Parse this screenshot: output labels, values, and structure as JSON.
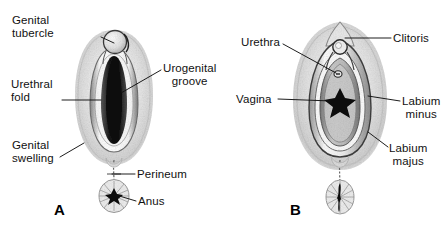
{
  "figure": {
    "type": "anatomical-diagram",
    "background_color": "#ffffff",
    "ink_color": "#1a1a1a",
    "panels": [
      {
        "id": "A",
        "letter": "A",
        "letter_pos": {
          "x": 54,
          "y": 201
        },
        "stage": "indifferent / early stage",
        "labels": [
          {
            "name": "genital-tubercle",
            "lines": [
              "Genital",
              "tubercle"
            ],
            "text": "Genital tubercle",
            "x": 12,
            "y": 14,
            "align": "left",
            "leader": [
              [
                101,
                37
              ],
              [
                114,
                43
              ]
            ]
          },
          {
            "name": "urethral-fold",
            "lines": [
              "Urethral",
              "fold"
            ],
            "text": "Urethral fold",
            "x": 11,
            "y": 78,
            "align": "left",
            "leader": [
              [
                62,
                100
              ],
              [
                101,
                100
              ]
            ]
          },
          {
            "name": "urogenital-groove",
            "lines": [
              "Urogenital",
              "groove"
            ],
            "text": "Urogenital groove",
            "x": 163,
            "y": 62,
            "align": "left",
            "leader": [
              [
                161,
                70
              ],
              [
                121,
                93
              ]
            ]
          },
          {
            "name": "genital-swelling",
            "lines": [
              "Genital",
              "swelling"
            ],
            "text": "Genital swelling",
            "x": 12,
            "y": 139,
            "align": "left",
            "leader": [
              [
                60,
                157
              ],
              [
                84,
                143
              ]
            ]
          },
          {
            "name": "perineum",
            "lines": [
              "Perineum"
            ],
            "text": "Perineum",
            "x": 137,
            "y": 168,
            "align": "left",
            "leader": [
              [
                135,
                174
              ],
              [
                112,
                174
              ]
            ]
          },
          {
            "name": "anus",
            "lines": [
              "Anus"
            ],
            "text": "Anus",
            "x": 138,
            "y": 195,
            "align": "left",
            "leader": [
              [
                136,
                201
              ],
              [
                116,
                195
              ]
            ]
          }
        ]
      },
      {
        "id": "B",
        "letter": "B",
        "letter_pos": {
          "x": 290,
          "y": 201
        },
        "stage": "female",
        "labels": [
          {
            "name": "urethra",
            "lines": [
              "Urethra"
            ],
            "text": "Urethra",
            "x": 241,
            "y": 36,
            "align": "left",
            "leader": [
              [
                283,
                44
              ],
              [
                336,
                73
              ]
            ]
          },
          {
            "name": "clitoris",
            "lines": [
              "Clitoris"
            ],
            "text": "Clitoris",
            "x": 393,
            "y": 32,
            "align": "left",
            "leader": [
              [
                391,
                38
              ],
              [
                345,
                38
              ]
            ]
          },
          {
            "name": "vagina",
            "lines": [
              "Vagina"
            ],
            "text": "Vagina",
            "x": 236,
            "y": 93,
            "align": "left",
            "leader": [
              [
                278,
                99
              ],
              [
                331,
                101
              ]
            ]
          },
          {
            "name": "labium-minus",
            "lines": [
              "Labium",
              "minus"
            ],
            "text": "Labium minus",
            "x": 402,
            "y": 95,
            "align": "left",
            "leader": [
              [
                400,
                101
              ],
              [
                368,
                96
              ]
            ]
          },
          {
            "name": "labium-majus",
            "lines": [
              "Labium",
              "majus"
            ],
            "text": "Labium majus",
            "x": 389,
            "y": 142,
            "align": "left",
            "leader": [
              [
                388,
                147
              ],
              [
                368,
                132
              ]
            ]
          }
        ]
      }
    ]
  }
}
